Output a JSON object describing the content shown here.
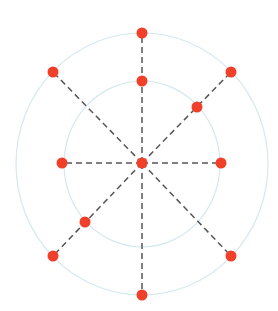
{
  "diagram": {
    "type": "radial-points",
    "center": {
      "x": 142,
      "y": 163
    },
    "colors": {
      "point": "#f0402a",
      "spoke": "#555555",
      "ring": "#d3e9ef",
      "background": "#ffffff"
    },
    "rings": [
      {
        "name": "inner-ring",
        "rx": 78,
        "ry": 83
      },
      {
        "name": "outer-ring",
        "rx": 126,
        "ry": 131
      }
    ],
    "spokes": [
      {
        "name": "spoke-up",
        "x": 142,
        "y": 33
      },
      {
        "name": "spoke-down",
        "x": 142,
        "y": 295
      },
      {
        "name": "spoke-left",
        "x": 62,
        "y": 163
      },
      {
        "name": "spoke-right",
        "x": 221,
        "y": 163
      },
      {
        "name": "spoke-up-left",
        "x": 53,
        "y": 72
      },
      {
        "name": "spoke-up-right",
        "x": 231,
        "y": 72
      },
      {
        "name": "spoke-down-left",
        "x": 53,
        "y": 256
      },
      {
        "name": "spoke-down-right",
        "x": 231,
        "y": 256
      }
    ],
    "points": [
      {
        "name": "center-point",
        "x": 142,
        "y": 163
      },
      {
        "name": "outer-top-point",
        "x": 142,
        "y": 33
      },
      {
        "name": "inner-top-point",
        "x": 142,
        "y": 81
      },
      {
        "name": "outer-bottom-point",
        "x": 142,
        "y": 295
      },
      {
        "name": "inner-left-point",
        "x": 62,
        "y": 163
      },
      {
        "name": "inner-right-point",
        "x": 221,
        "y": 163
      },
      {
        "name": "outer-upper-left-point",
        "x": 53,
        "y": 72
      },
      {
        "name": "outer-upper-right-point",
        "x": 231,
        "y": 72
      },
      {
        "name": "inner-upper-right-point",
        "x": 197,
        "y": 107
      },
      {
        "name": "inner-lower-left-point",
        "x": 85,
        "y": 222
      },
      {
        "name": "outer-lower-left-point",
        "x": 53,
        "y": 256
      },
      {
        "name": "outer-lower-right-point",
        "x": 231,
        "y": 256
      }
    ],
    "point_radius": 5.5
  }
}
